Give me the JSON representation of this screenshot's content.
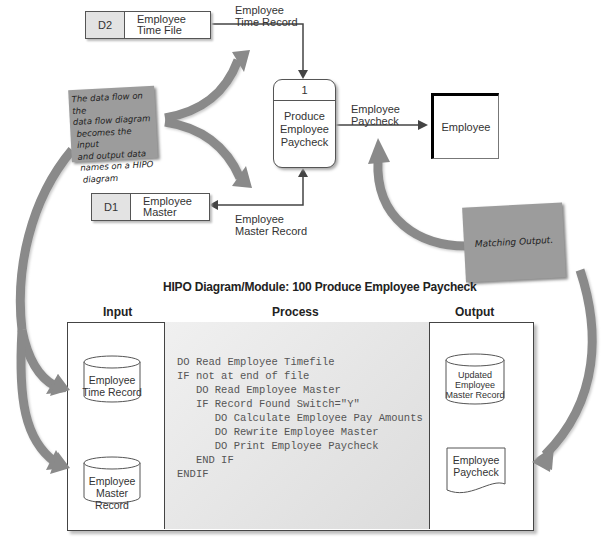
{
  "dfd": {
    "data_stores": [
      {
        "id": "D2",
        "name_line1": "Employee",
        "name_line2": "Time File"
      },
      {
        "id": "D1",
        "name_line1": "Employee",
        "name_line2": "Master"
      }
    ],
    "process": {
      "number": "1",
      "name_line1": "Produce",
      "name_line2": "Employee",
      "name_line3": "Paycheck"
    },
    "entity": {
      "name": "Employee"
    },
    "flows": [
      {
        "line1": "Employee",
        "line2": "Time Record"
      },
      {
        "line1": "Employee",
        "line2": "Paycheck"
      },
      {
        "line1": "Employee",
        "line2": "Master Record"
      }
    ]
  },
  "notes": {
    "left": {
      "lines": [
        "The data flow on the",
        "data flow diagram",
        "becomes the input",
        "and output data",
        "names on a HIPO",
        "diagram"
      ]
    },
    "right": {
      "text": "Matching Output."
    }
  },
  "hipo": {
    "title": "HIPO Diagram/Module:  100 Produce Employee Paycheck",
    "columns": {
      "input": "Input",
      "process": "Process",
      "output": "Output"
    },
    "inputs": [
      {
        "line1": "Employee",
        "line2": "Time Record"
      },
      {
        "line1": "Employee",
        "line2": "Master Record"
      }
    ],
    "process_code": "DO Read Employee Timefile\nIF not at end of file\n   DO Read Employee Master\n   IF Record Found Switch=\"Y\"\n      DO Calculate Employee Pay Amounts\n      DO Rewrite Employee Master\n      DO Print Employee Paycheck\n   END IF\nENDIF",
    "outputs": {
      "file": {
        "line1": "Updated",
        "line2": "Employee",
        "line3": "Master Record"
      },
      "document": {
        "line1": "Employee",
        "line2": "Paycheck"
      }
    }
  },
  "colors": {
    "arrow_gray": "#8a8a8a",
    "note_gray": "#9c9c9c",
    "store_id_fill": "#e3e3e3",
    "line": "#555555"
  }
}
